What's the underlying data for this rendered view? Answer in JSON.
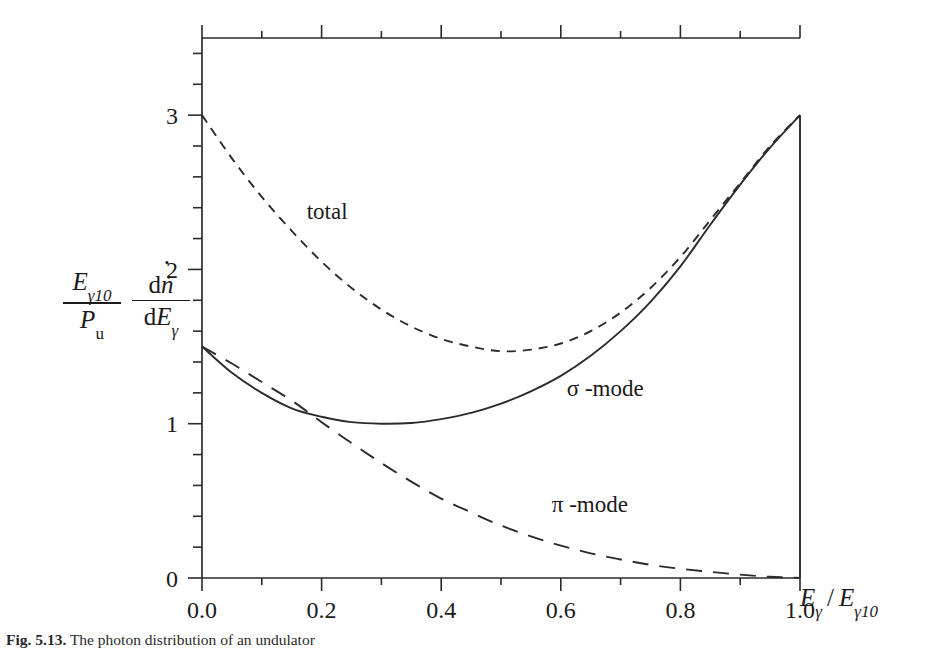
{
  "figure": {
    "caption_number": "Fig. 5.13.",
    "caption_text": "The photon distribution of an undulator"
  },
  "axes": {
    "x": {
      "label_parts": {
        "numerator": "E",
        "numerator_sub": "γ",
        "denominator": "E",
        "denominator_sub": "γ10"
      },
      "label_plain": "Eγ / Eγ10",
      "ticks": [
        "0.0",
        "0.2",
        "0.4",
        "0.6",
        "0.8",
        "1.0"
      ],
      "tick_values": [
        0.0,
        0.2,
        0.4,
        0.6,
        0.8,
        1.0
      ],
      "minor_step": 0.1,
      "min": 0.0,
      "max": 1.0
    },
    "y": {
      "label_frac1_num": "E",
      "label_frac1_num_sub": "γ10",
      "label_frac1_den": "P",
      "label_frac1_den_sub": "u",
      "label_frac2_num_d": "d",
      "label_frac2_num_n": "ṅ",
      "label_frac2_den_d": "d",
      "label_frac2_den_e": "E",
      "label_frac2_den_sub": "γ",
      "label_plain": "(Eγ10 / Pᵤ) (dṅ / dEγ)",
      "ticks": [
        "0",
        "1",
        "2",
        "3"
      ],
      "tick_values": [
        0,
        1,
        2,
        3
      ],
      "minor_step": 0.2,
      "min": 0.0,
      "max": 3.5
    }
  },
  "annotations": [
    {
      "name": "total",
      "text": "total",
      "x": 0.175,
      "y": 2.33
    },
    {
      "name": "sigma-mode",
      "text": "σ -mode",
      "x": 0.61,
      "y": 1.18
    },
    {
      "name": "pi-mode",
      "text": "π -mode",
      "x": 0.585,
      "y": 0.43
    }
  ],
  "chart_data": {
    "type": "line",
    "title": "",
    "xlabel": "Eγ / Eγ10",
    "ylabel": "(Eγ10 / Pᵤ) (dṅ / dEγ)",
    "xlim": [
      0.0,
      1.0
    ],
    "ylim": [
      0.0,
      3.5
    ],
    "grid": false,
    "legend": "inline-annotations",
    "x": [
      0.0,
      0.05,
      0.1,
      0.15,
      0.2,
      0.25,
      0.3,
      0.35,
      0.4,
      0.45,
      0.5,
      0.55,
      0.6,
      0.65,
      0.7,
      0.75,
      0.8,
      0.85,
      0.9,
      0.95,
      1.0
    ],
    "series": [
      {
        "name": "total",
        "style": "short-dashed",
        "values": [
          3.0,
          2.72,
          2.47,
          2.25,
          2.05,
          1.88,
          1.74,
          1.63,
          1.55,
          1.5,
          1.47,
          1.48,
          1.52,
          1.6,
          1.72,
          1.88,
          2.08,
          2.32,
          2.56,
          2.8,
          3.0
        ]
      },
      {
        "name": "σ-mode",
        "style": "solid",
        "values": [
          1.5,
          1.33,
          1.2,
          1.1,
          1.045,
          1.01,
          1.0,
          1.005,
          1.03,
          1.07,
          1.13,
          1.21,
          1.31,
          1.44,
          1.6,
          1.79,
          2.02,
          2.29,
          2.55,
          2.79,
          3.0
        ]
      },
      {
        "name": "π-mode",
        "style": "long-dashed",
        "values": [
          1.5,
          1.39,
          1.27,
          1.15,
          1.01,
          0.875,
          0.745,
          0.625,
          0.515,
          0.425,
          0.34,
          0.27,
          0.21,
          0.16,
          0.12,
          0.085,
          0.06,
          0.04,
          0.022,
          0.008,
          0.0
        ]
      }
    ],
    "drop_line": {
      "x": 1.0,
      "from_y": 3.0,
      "to_y": 0.0
    }
  },
  "colors": {
    "ink": "#2b2b2b",
    "background": "#ffffff"
  }
}
